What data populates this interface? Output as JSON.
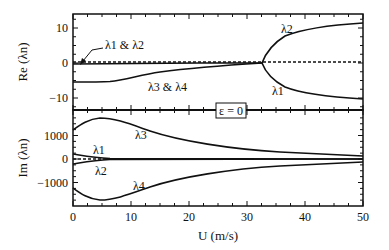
{
  "chart_data": [
    {
      "type": "line",
      "panel": "top",
      "ylabel": "Re (λn)",
      "xlabel": "",
      "xlim": [
        0,
        50
      ],
      "ylim": [
        -14,
        14
      ],
      "yticks": [
        10,
        0,
        -10
      ],
      "ytick_labels": [
        "10",
        "0",
        "−10"
      ],
      "series": [
        {
          "name": "λ1 & λ2",
          "x": [
            0,
            5,
            10,
            20,
            30,
            32.5
          ],
          "y": [
            -0.3,
            -0.1,
            0,
            0.1,
            0.1,
            0.1
          ]
        },
        {
          "name": "λ3 & λ4",
          "x": [
            0,
            5,
            8,
            12,
            20,
            28,
            32.5
          ],
          "y": [
            -5.5,
            -5.5,
            -5.2,
            -3.5,
            -1.8,
            -0.6,
            0.1
          ]
        },
        {
          "name": "λ2",
          "x": [
            32.5,
            33,
            35,
            38,
            42,
            46,
            50
          ],
          "y": [
            0.1,
            3,
            5.5,
            7.5,
            9,
            10,
            10.5
          ]
        },
        {
          "name": "λ1",
          "x": [
            32.5,
            33,
            35,
            38,
            42,
            46,
            50
          ],
          "y": [
            0.1,
            -3,
            -5.5,
            -7.5,
            -9,
            -9.8,
            -10.5
          ]
        },
        {
          "name": "zero reference (dashed)",
          "x": [
            0,
            50
          ],
          "y": [
            0.4,
            0.4
          ]
        }
      ],
      "annotations": [
        "λ1 & λ2",
        "λ3 & λ4",
        "λ2",
        "λ1"
      ]
    },
    {
      "type": "line",
      "panel": "bottom",
      "ylabel": "Im (λn)",
      "xlabel": "U (m/s)",
      "xlim": [
        0,
        50
      ],
      "ylim": [
        -2000,
        2000
      ],
      "xticks": [
        0,
        10,
        20,
        30,
        40,
        50
      ],
      "yticks": [
        1000,
        0,
        -1000
      ],
      "ytick_labels": [
        "1000",
        "0",
        "−1000"
      ],
      "series": [
        {
          "name": "λ3",
          "x": [
            0,
            2,
            5,
            8,
            12,
            20,
            30,
            40,
            50
          ],
          "y": [
            1200,
            1550,
            1750,
            1700,
            1450,
            1050,
            750,
            550,
            450
          ]
        },
        {
          "name": "λ4",
          "x": [
            0,
            2,
            5,
            8,
            12,
            20,
            30,
            40,
            50
          ],
          "y": [
            -1200,
            -1550,
            -1750,
            -1700,
            -1450,
            -1050,
            -750,
            -550,
            -450
          ]
        },
        {
          "name": "λ1",
          "x": [
            0,
            5,
            10,
            20,
            50
          ],
          "y": [
            200,
            80,
            40,
            30,
            20
          ]
        },
        {
          "name": "λ2",
          "x": [
            0,
            5,
            10,
            20,
            50
          ],
          "y": [
            -200,
            -80,
            -40,
            -30,
            -20
          ]
        },
        {
          "name": "zero reference (dashed)",
          "x": [
            0,
            50
          ],
          "y": [
            0,
            0
          ]
        }
      ],
      "annotations": [
        "λ3",
        "λ1",
        "λ2",
        "λ4"
      ]
    }
  ],
  "labels": {
    "top_ylabel": "Re (λn)",
    "bottom_ylabel": "Im (λn)",
    "xlabel": "U (m/s)",
    "epsilon_box": "ε = 0",
    "top_yticks": [
      "10",
      "0",
      "−10"
    ],
    "bottom_yticks": [
      "1000",
      "0",
      "−1000"
    ],
    "xticks": [
      "0",
      "10",
      "20",
      "30",
      "40",
      "50"
    ],
    "curve_labels": {
      "l12_top": "λ1 & λ2",
      "l34_top": "λ3 & λ4",
      "l2_top": "λ2",
      "l1_top": "λ1",
      "l3_bot": "λ3",
      "l1_bot": "λ1",
      "l2_bot": "λ2",
      "l4_bot": "λ4"
    }
  }
}
